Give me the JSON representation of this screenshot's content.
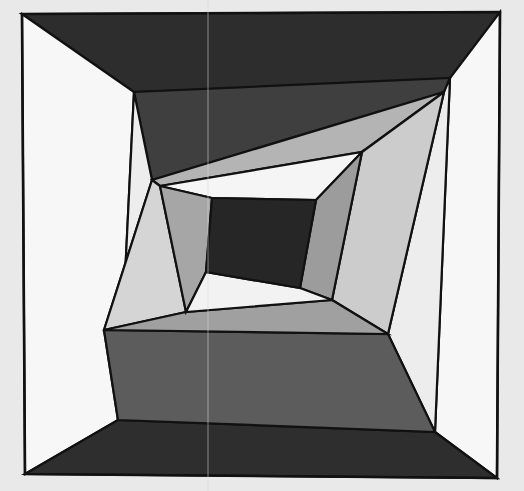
{
  "artwork": {
    "title": "Nested Quadrilateral Composition",
    "medium": "abstract geometric raster image",
    "canvas": {
      "width": 524,
      "height": 491
    },
    "background_color": "#e9e9e9",
    "outline_color": "#111111",
    "outline_width": 2.2,
    "structure": "recursive concentric quadrilateral subdivision (log-cabin style), 5 nested rings plus a near-black core",
    "seam_line": {
      "description": "faint vertical scanner seam artifact near horizontal center",
      "color": "#d8d8d8",
      "x": 208
    },
    "palette": [
      {
        "name": "core-black",
        "hex": "#262626"
      },
      {
        "name": "near-black",
        "hex": "#2b2b2b"
      },
      {
        "name": "very-dark-gray",
        "hex": "#343434"
      },
      {
        "name": "dark-gray",
        "hex": "#3f3f3f"
      },
      {
        "name": "charcoal",
        "hex": "#4c4c4c"
      },
      {
        "name": "mid-dark-gray",
        "hex": "#5a5a5a"
      },
      {
        "name": "mid-gray",
        "hex": "#8d8d8d"
      },
      {
        "name": "gray",
        "hex": "#9b9b9b"
      },
      {
        "name": "light-mid-gray",
        "hex": "#a8a8a8"
      },
      {
        "name": "light-gray",
        "hex": "#bdbdbd"
      },
      {
        "name": "pale-gray",
        "hex": "#d2d2d2"
      },
      {
        "name": "off-white",
        "hex": "#ededed"
      },
      {
        "name": "white",
        "hex": "#f7f7f7"
      }
    ],
    "frame": {
      "name": "outer-frame-quad",
      "points": "22,14 500,12 497,478 25,474"
    },
    "shapes": [
      {
        "name": "ring1-top-band",
        "ring": 1,
        "fill": "#2d2d2d",
        "points": "22,14 500,12 498,78 134,92"
      },
      {
        "name": "ring1-left-band",
        "ring": 1,
        "fill": "#f7f7f7",
        "points": "22,14 134,92 118,420 25,474"
      },
      {
        "name": "ring1-right-band",
        "ring": 1,
        "fill": "#f7f7f7",
        "points": "500,12 497,478 435,432 450,78"
      },
      {
        "name": "ring1-bottom-band",
        "ring": 1,
        "fill": "#2e2e2e",
        "points": "25,474 118,420 435,432 497,478"
      },
      {
        "name": "ring2-top-band",
        "ring": 2,
        "fill": "#3f3f3f",
        "points": "134,92 450,78 444,92 152,180"
      },
      {
        "name": "ring2-left-band",
        "ring": 2,
        "fill": "#ededed",
        "points": "134,92 152,180 104,330 118,420"
      },
      {
        "name": "ring2-right-band",
        "ring": 2,
        "fill": "#ededed",
        "points": "450,78 435,432 388,334 444,92"
      },
      {
        "name": "ring2-bottom-band",
        "ring": 2,
        "fill": "#5c5c5c",
        "points": "118,420 104,330 388,334 435,432"
      },
      {
        "name": "ring3-top-band",
        "ring": 3,
        "fill": "#b4b4b4",
        "points": "152,180 444,92 362,152 160,186"
      },
      {
        "name": "ring3-left-band",
        "ring": 3,
        "fill": "#d5d5d5",
        "points": "152,180 160,186 186,312 104,330"
      },
      {
        "name": "ring3-right-band",
        "ring": 3,
        "fill": "#cccccc",
        "points": "444,92 388,334 332,300 362,152"
      },
      {
        "name": "ring3-bottom-band",
        "ring": 3,
        "fill": "#a0a0a0",
        "points": "104,330 186,312 332,300 388,334"
      },
      {
        "name": "ring4-top-band",
        "ring": 4,
        "fill": "#f5f5f5",
        "points": "160,186 362,152 316,200 212,198"
      },
      {
        "name": "ring4-left-band",
        "ring": 4,
        "fill": "#a6a6a6",
        "points": "160,186 212,198 206,272 186,312"
      },
      {
        "name": "ring4-right-band",
        "ring": 4,
        "fill": "#9c9c9c",
        "points": "362,152 332,300 300,288 316,200"
      },
      {
        "name": "ring4-bottom-band",
        "ring": 4,
        "fill": "#f2f2f2",
        "points": "186,312 206,272 300,288 332,300"
      },
      {
        "name": "core-quad",
        "ring": 5,
        "fill": "#262626",
        "points": "212,198 316,200 300,288 206,272"
      }
    ]
  }
}
